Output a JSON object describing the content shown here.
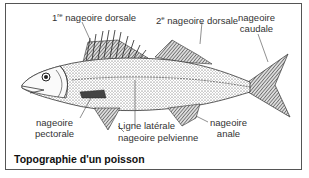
{
  "diagram": {
    "title": "Topographie d'un poisson",
    "labels": {
      "first_dorsal": {
        "ordinal": "1",
        "suffix": "re",
        "text": "nageoire dorsale"
      },
      "second_dorsal": {
        "ordinal": "2",
        "suffix": "e",
        "text": "nageoire dorsale"
      },
      "caudal": {
        "line1": "nageoire",
        "line2": "caudale"
      },
      "pectoral": {
        "line1": "nageoire",
        "line2": "pectorale"
      },
      "lateral_line": "Ligne latérale",
      "pelvic": "nageoire pelvienne",
      "anal": {
        "line1": "nageoire",
        "line2": "anale"
      }
    },
    "colors": {
      "stroke": "#333333",
      "fill_dark": "#555555",
      "background": "#ffffff"
    }
  }
}
